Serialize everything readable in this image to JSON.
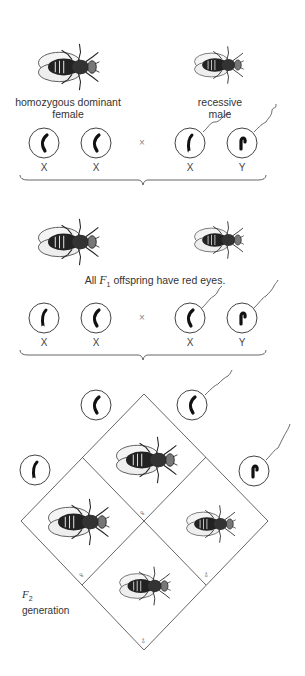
{
  "parents": {
    "female_label_line1": "homozygous dominant",
    "female_label_line2": "female",
    "male_label_line1": "recessive",
    "male_label_line2": "male",
    "gametes": [
      "X",
      "X",
      "X",
      "Y"
    ],
    "cross_symbol": "×"
  },
  "f1": {
    "caption_prefix": "All ",
    "caption_f": "F",
    "caption_sub": "1",
    "caption_suffix": " offspring have red eyes.",
    "gametes": [
      "X",
      "X",
      "X",
      "Y"
    ],
    "cross_symbol": "×"
  },
  "f2": {
    "label_f": "F",
    "label_sub": "2",
    "label_word": "generation",
    "cells": [
      {
        "position": "top",
        "sex_symbol": "♀"
      },
      {
        "position": "left",
        "sex_symbol": "♀"
      },
      {
        "position": "right",
        "sex_symbol": "♂"
      },
      {
        "position": "bottom",
        "sex_symbol": "♂"
      }
    ]
  },
  "colors": {
    "line": "#555555",
    "chromosome": "#111111",
    "text": "#333333"
  }
}
